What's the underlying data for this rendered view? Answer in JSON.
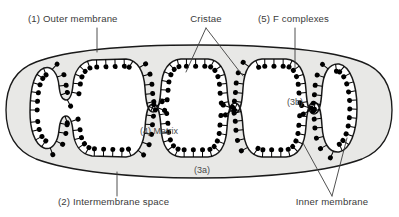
{
  "figure": {
    "width": 399,
    "height": 217,
    "background": "#ffffff"
  },
  "colors": {
    "outline": "#1a1a1a",
    "intermembrane_fill": "#e8e8e6",
    "matrix_fill": "#ffffff",
    "f_complex": "#000000",
    "label_text": "#3a3a3a",
    "leader_line": "#3d3d3d",
    "page_background": "#ffffff"
  },
  "labels": [
    {
      "id": "outer-membrane",
      "text": "(1) Outer membrane",
      "number": "1",
      "name": "Outer membrane",
      "x": 28,
      "y": 22,
      "anchor": "start",
      "leader": "vertical"
    },
    {
      "id": "cristae",
      "text": "Cristae",
      "number": "",
      "name": "Cristae",
      "x": 206,
      "y": 22,
      "anchor": "middle",
      "leader": "forked"
    },
    {
      "id": "f-complexes",
      "text": "(5) F complexes",
      "number": "5",
      "name": "F complexes",
      "x": 258,
      "y": 22,
      "anchor": "start",
      "leader": "vertical"
    },
    {
      "id": "matrix",
      "text": "(4) Matrix",
      "number": "4",
      "name": "Matrix",
      "x": 140,
      "y": 134,
      "anchor": "start",
      "leader": "none"
    },
    {
      "id": "crista-3b",
      "text": "(3b)",
      "number": "3b",
      "name": "Crista lumen",
      "x": 287,
      "y": 105,
      "anchor": "start",
      "leader": "none"
    },
    {
      "id": "crista-3a",
      "text": "(3a)",
      "number": "3a",
      "name": "Cristal space",
      "x": 194,
      "y": 173,
      "anchor": "start",
      "leader": "none"
    },
    {
      "id": "intermembrane-space",
      "text": "(2) Intermembrane space",
      "number": "2",
      "name": "Intermembrane space",
      "x": 58,
      "y": 205,
      "anchor": "start",
      "leader": "vertical"
    },
    {
      "id": "inner-membrane",
      "text": "Inner membrane",
      "number": "",
      "name": "Inner membrane",
      "x": 332,
      "y": 205,
      "anchor": "middle",
      "leader": "forked"
    }
  ],
  "structures": {
    "outer_membrane_label": "Outer membrane",
    "inner_membrane_label": "Inner membrane",
    "matrix_label": "Matrix",
    "intermembrane_space_label": "Intermembrane space",
    "cristae_label": "Cristae",
    "f_complexes_label": "F complexes"
  }
}
